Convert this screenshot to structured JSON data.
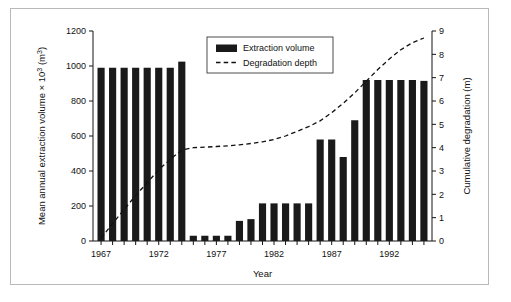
{
  "chart_data": {
    "type": "bar",
    "title": "",
    "subtitle": "",
    "xlabel": "Year",
    "ylabel": "Mean annual extraction volume × 10³ (m³)",
    "y2label": "Cumulative degradation (m)",
    "ylim": [
      0,
      1200
    ],
    "y2lim": [
      0,
      9
    ],
    "xlim": [
      1966.3,
      1995.7
    ],
    "grid": false,
    "legend_position": "top-center",
    "y_ticks": [
      0,
      200,
      400,
      600,
      800,
      1000,
      1200
    ],
    "y2_ticks": [
      0,
      1,
      2,
      3,
      4,
      5,
      6,
      7,
      8,
      9
    ],
    "x_tick_labels": [
      "1967",
      "1972",
      "1977",
      "1982",
      "1987",
      "1992"
    ],
    "x_tick_values": [
      1967,
      1972,
      1977,
      1982,
      1987,
      1992
    ],
    "categories": [
      1967,
      1968,
      1969,
      1970,
      1971,
      1972,
      1973,
      1974,
      1975,
      1976,
      1977,
      1978,
      1979,
      1980,
      1981,
      1982,
      1983,
      1984,
      1985,
      1986,
      1987,
      1988,
      1989,
      1990,
      1991,
      1992,
      1993,
      1994,
      1995
    ],
    "series": [
      {
        "name": "Extraction volume",
        "type": "bar",
        "axis": "left",
        "color": "#1a1a1a",
        "values": [
          990,
          990,
          990,
          990,
          990,
          990,
          990,
          1025,
          30,
          30,
          30,
          30,
          115,
          125,
          215,
          215,
          215,
          215,
          215,
          580,
          580,
          480,
          690,
          920,
          920,
          920,
          920,
          920,
          915
        ]
      },
      {
        "name": "Degradation depth",
        "type": "line",
        "axis": "right",
        "color": "#111111",
        "style": "dashed",
        "values": [
          0.12,
          0.75,
          1.35,
          1.95,
          2.5,
          3.05,
          3.5,
          3.9,
          4.0,
          4.02,
          4.05,
          4.08,
          4.12,
          4.18,
          4.25,
          4.35,
          4.5,
          4.7,
          4.9,
          5.15,
          5.5,
          5.9,
          6.35,
          6.85,
          7.35,
          7.8,
          8.2,
          8.5,
          8.7
        ]
      }
    ],
    "legend": [
      {
        "label": "Extraction volume",
        "marker": "filled-rect",
        "color": "#1a1a1a"
      },
      {
        "label": "Degradation depth",
        "marker": "dashed-line",
        "color": "#111111"
      }
    ]
  }
}
